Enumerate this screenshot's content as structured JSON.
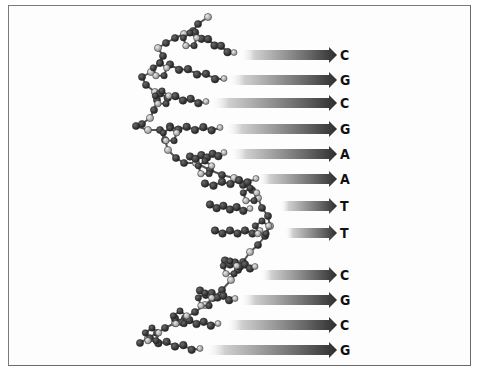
{
  "figure": {
    "colors": {
      "frame": "#707070",
      "arrow_dark": "#2e2e2e",
      "arrow_light": "#ffffff",
      "atom_dark": "#2a2a2a",
      "atom_light": "#b8b8b8",
      "bond": "#555555",
      "label": "#111111"
    },
    "bases": [
      {
        "label": "C",
        "y": 55,
        "arrow_start_x": 240
      },
      {
        "label": "G",
        "y": 80,
        "arrow_start_x": 228
      },
      {
        "label": "C",
        "y": 103,
        "arrow_start_x": 210
      },
      {
        "label": "G",
        "y": 129,
        "arrow_start_x": 225
      },
      {
        "label": "A",
        "y": 154,
        "arrow_start_x": 230
      },
      {
        "label": "A",
        "y": 179,
        "arrow_start_x": 258
      },
      {
        "label": "T",
        "y": 206,
        "arrow_start_x": 280
      },
      {
        "label": "T",
        "y": 233,
        "arrow_start_x": 285
      },
      {
        "label": "C",
        "y": 275,
        "arrow_start_x": 260
      },
      {
        "label": "G",
        "y": 300,
        "arrow_start_x": 240
      },
      {
        "label": "C",
        "y": 325,
        "arrow_start_x": 225
      },
      {
        "label": "G",
        "y": 350,
        "arrow_start_x": 205
      }
    ],
    "sequence": "CGCGAATTCGCG"
  }
}
